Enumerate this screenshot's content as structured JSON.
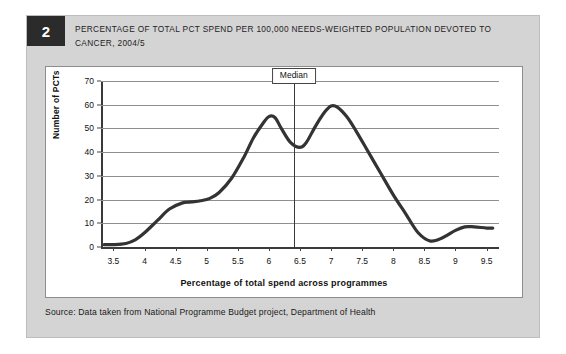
{
  "figure": {
    "number": "2",
    "title": "PERCENTAGE OF TOTAL PCT SPEND PER 100,000 NEEDS-WEIGHTED POPULATION DEVOTED TO CANCER, 2004/5",
    "source": "Source: Data taken from National Programme Budget project, Department of Health",
    "panel_bg": "#ffffff",
    "frame_bg": "#d4d4d4",
    "badge_bg": "#2b2b2b",
    "curve_color": "#333333",
    "grid_color": "#8e8e8e"
  },
  "chart_data": {
    "type": "line",
    "title": "PERCENTAGE OF TOTAL PCT SPEND PER 100,000 NEEDS-WEIGHTED POPULATION DEVOTED TO CANCER, 2004/5",
    "xlabel": "Percentage of total spend across programmes",
    "ylabel": "Number of PCTs",
    "xlim": [
      3.3,
      9.7
    ],
    "ylim": [
      0,
      70
    ],
    "grid": true,
    "legend": null,
    "xticks": [
      "3.5",
      "4",
      "4.5",
      "5",
      "5.5",
      "6",
      "6.5",
      "7",
      "7.5",
      "8",
      "8.5",
      "9",
      "9.5"
    ],
    "xtick_values": [
      3.5,
      4,
      4.5,
      5,
      5.5,
      6,
      6.5,
      7,
      7.5,
      8,
      8.5,
      9,
      9.5
    ],
    "yticks": [
      "0",
      "10",
      "20",
      "30",
      "40",
      "50",
      "60",
      "70"
    ],
    "ytick_values": [
      0,
      10,
      20,
      30,
      40,
      50,
      60,
      70
    ],
    "annotations": [
      {
        "label": "Median",
        "type": "vertical-line",
        "x": 6.4
      }
    ],
    "series": [
      {
        "name": "Number of PCTs",
        "x": [
          3.35,
          3.5,
          3.7,
          3.85,
          4.0,
          4.2,
          4.4,
          4.6,
          4.75,
          4.9,
          5.05,
          5.2,
          5.4,
          5.6,
          5.75,
          5.9,
          6.0,
          6.1,
          6.2,
          6.35,
          6.5,
          6.6,
          6.75,
          6.9,
          7.0,
          7.1,
          7.25,
          7.4,
          7.6,
          7.8,
          8.0,
          8.2,
          8.4,
          8.6,
          8.8,
          9.0,
          9.15,
          9.3,
          9.5,
          9.6
        ],
        "values": [
          1,
          1,
          1.5,
          3,
          6,
          11,
          16,
          18.5,
          19,
          19.5,
          20.5,
          23,
          29,
          38,
          46,
          52,
          55,
          54.5,
          50,
          44,
          42,
          44,
          51,
          57,
          59.5,
          59,
          55,
          49,
          40,
          31,
          22,
          14,
          6,
          2.5,
          4,
          7,
          8.5,
          8.5,
          8,
          8
        ]
      }
    ]
  }
}
